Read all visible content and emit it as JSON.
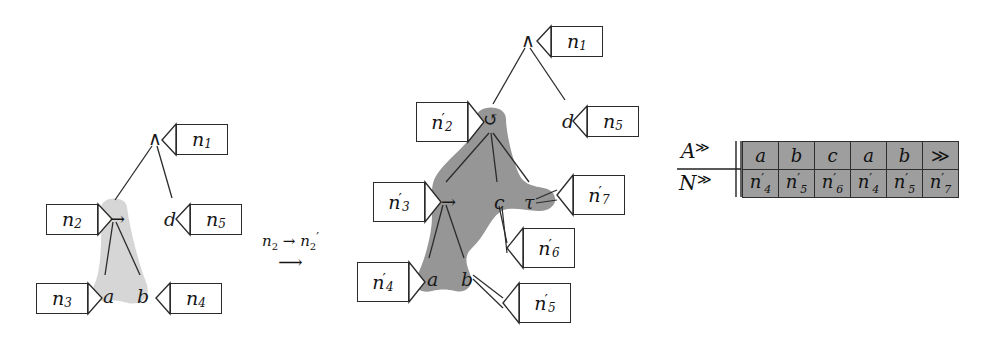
{
  "figure": {
    "caption": "",
    "left_tree": {
      "name": "left-tree",
      "nodes": [
        {
          "id": "root",
          "glyph": "∧",
          "x": 148,
          "y": 129,
          "italic": false
        },
        {
          "id": "impl",
          "glyph": "→",
          "x": 110,
          "y": 210,
          "italic": false
        },
        {
          "id": "d",
          "glyph": "d",
          "x": 164,
          "y": 210,
          "italic": true
        },
        {
          "id": "a",
          "glyph": "a",
          "x": 103,
          "y": 287,
          "italic": true
        },
        {
          "id": "b",
          "glyph": "b",
          "x": 137,
          "y": 287,
          "italic": true
        }
      ],
      "callouts": [
        {
          "id": "n1",
          "label": "n",
          "sub": "1",
          "prime": false,
          "x": 176,
          "y": 124,
          "w": 52,
          "h": 31,
          "dir": "left"
        },
        {
          "id": "n2",
          "label": "n",
          "sub": "2",
          "prime": false,
          "x": 46,
          "y": 204,
          "w": 52,
          "h": 31,
          "dir": "right"
        },
        {
          "id": "n5",
          "label": "n",
          "sub": "5",
          "prime": false,
          "x": 190,
          "y": 204,
          "w": 52,
          "h": 31,
          "dir": "left"
        },
        {
          "id": "n3",
          "label": "n",
          "sub": "3",
          "prime": false,
          "x": 36,
          "y": 283,
          "w": 52,
          "h": 31,
          "dir": "right"
        },
        {
          "id": "n4",
          "label": "n",
          "sub": "4",
          "prime": false,
          "x": 170,
          "y": 283,
          "w": 52,
          "h": 31,
          "dir": "left"
        }
      ]
    },
    "transition": {
      "name": "transition-label",
      "from": "n",
      "from_sub": "2",
      "arrow": "→",
      "to": "n",
      "to_sub": "2",
      "to_prime": "′",
      "long_arrow": "⟶"
    },
    "right_tree": {
      "name": "right-tree",
      "nodes": [
        {
          "id": "root",
          "glyph": "∧",
          "x": 521,
          "y": 31,
          "italic": false
        },
        {
          "id": "loop",
          "glyph": "↺",
          "x": 483,
          "y": 112,
          "italic": false
        },
        {
          "id": "d",
          "glyph": "d",
          "x": 562,
          "y": 112,
          "italic": true
        },
        {
          "id": "impl",
          "glyph": "→",
          "x": 441,
          "y": 193,
          "italic": false
        },
        {
          "id": "c",
          "glyph": "c",
          "x": 494,
          "y": 193,
          "italic": true
        },
        {
          "id": "tau",
          "glyph": "τ",
          "x": 524,
          "y": 193,
          "italic": true
        },
        {
          "id": "a",
          "glyph": "a",
          "x": 427,
          "y": 270,
          "italic": true
        },
        {
          "id": "b",
          "glyph": "b",
          "x": 461,
          "y": 270,
          "italic": true
        }
      ],
      "callouts": [
        {
          "id": "n1",
          "label": "n",
          "sub": "1",
          "prime": false,
          "x": 551,
          "y": 26,
          "w": 52,
          "h": 31,
          "dir": "left"
        },
        {
          "id": "n5",
          "label": "n",
          "sub": "5",
          "prime": false,
          "x": 587,
          "y": 106,
          "w": 52,
          "h": 31,
          "dir": "left"
        },
        {
          "id": "n2p",
          "label": "n",
          "sub": "2",
          "prime": true,
          "x": 416,
          "y": 102,
          "w": 52,
          "h": 40,
          "dir": "right"
        },
        {
          "id": "n3p",
          "label": "n",
          "sub": "3",
          "prime": true,
          "x": 373,
          "y": 182,
          "w": 52,
          "h": 40,
          "dir": "right"
        },
        {
          "id": "n7p",
          "label": "n",
          "sub": "7",
          "prime": true,
          "x": 573,
          "y": 175,
          "w": 52,
          "h": 40,
          "dir": "left"
        },
        {
          "id": "n6p",
          "label": "n",
          "sub": "6",
          "prime": true,
          "x": 523,
          "y": 228,
          "w": 52,
          "h": 40,
          "dir": "left"
        },
        {
          "id": "n4p",
          "label": "n",
          "sub": "4",
          "prime": true,
          "x": 357,
          "y": 262,
          "w": 52,
          "h": 40,
          "dir": "right"
        },
        {
          "id": "n5p",
          "label": "n",
          "sub": "5",
          "prime": true,
          "x": 519,
          "y": 283,
          "w": 52,
          "h": 40,
          "dir": "left"
        }
      ]
    },
    "table": {
      "name": "action-node-table",
      "row_headers": [
        {
          "letter": "A",
          "sup": "≫"
        },
        {
          "letter": "N",
          "sup": "≫"
        }
      ],
      "rows": [
        {
          "key": "A",
          "cells": [
            {
              "text": "a",
              "prime": false,
              "sub": ""
            },
            {
              "text": "b",
              "prime": false,
              "sub": ""
            },
            {
              "text": "c",
              "prime": false,
              "sub": ""
            },
            {
              "text": "a",
              "prime": false,
              "sub": ""
            },
            {
              "text": "b",
              "prime": false,
              "sub": ""
            },
            {
              "text": "≫",
              "prime": false,
              "sub": ""
            }
          ]
        },
        {
          "key": "N",
          "cells": [
            {
              "text": "n",
              "prime": true,
              "sub": "4"
            },
            {
              "text": "n",
              "prime": true,
              "sub": "5"
            },
            {
              "text": "n",
              "prime": true,
              "sub": "6"
            },
            {
              "text": "n",
              "prime": true,
              "sub": "4"
            },
            {
              "text": "n",
              "prime": true,
              "sub": "5"
            },
            {
              "text": "n",
              "prime": true,
              "sub": "7"
            }
          ]
        }
      ]
    },
    "colors": {
      "left_shade": "#d6d6d6",
      "right_shade": "#969696",
      "table_cell": "#9e9e9e",
      "stroke": "#2b2b2b",
      "text": "#141414"
    }
  }
}
